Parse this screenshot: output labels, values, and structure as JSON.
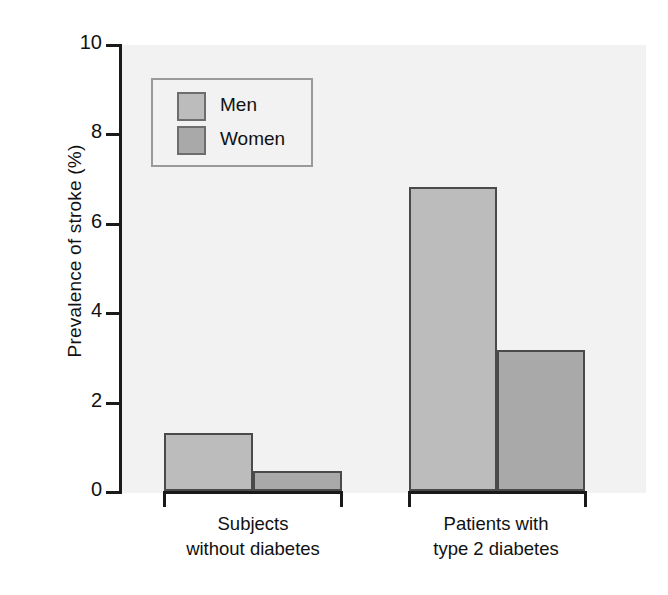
{
  "chart_data": {
    "type": "bar",
    "title": "",
    "subtitle": "",
    "xlabel": "",
    "ylabel": "Prevalence of stroke (%)",
    "categories": [
      "Subjects without diabetes",
      "Patients with type 2 diabetes"
    ],
    "category_lines": [
      [
        "Subjects",
        "without diabetes"
      ],
      [
        "Patients with",
        "type 2 diabetes"
      ]
    ],
    "series": [
      {
        "name": "Men",
        "values": [
          1.3,
          6.8
        ],
        "color": "#bcbcbc"
      },
      {
        "name": "Women",
        "values": [
          0.45,
          3.15
        ],
        "color": "#a9a9a9"
      }
    ],
    "ylim": [
      0,
      10
    ],
    "yticks": [
      0,
      2,
      4,
      6,
      8,
      10
    ],
    "ytick_labels": [
      "0",
      "2",
      "4",
      "6",
      "8",
      "10"
    ],
    "grid": false,
    "legend_position": "upper left",
    "legend_entries": [
      "Men",
      "Women"
    ],
    "plot_background": "#f2f2f2",
    "axis_color": "#1a1a1a",
    "bar_edge_color": "#4a4a4a"
  },
  "axis": {
    "ylabel": "Prevalence of stroke (%)",
    "ticks": [
      {
        "value": 10,
        "label": "10"
      },
      {
        "value": 8,
        "label": "8"
      },
      {
        "value": 6,
        "label": "6"
      },
      {
        "value": 4,
        "label": "4"
      },
      {
        "value": 2,
        "label": "2"
      },
      {
        "value": 0,
        "label": "0"
      }
    ]
  },
  "legend": {
    "men_label": "Men",
    "women_label": "Women"
  },
  "categories": {
    "group1_line1": "Subjects",
    "group1_line2": "without diabetes",
    "group2_line1": "Patients with",
    "group2_line2": "type 2 diabetes"
  }
}
